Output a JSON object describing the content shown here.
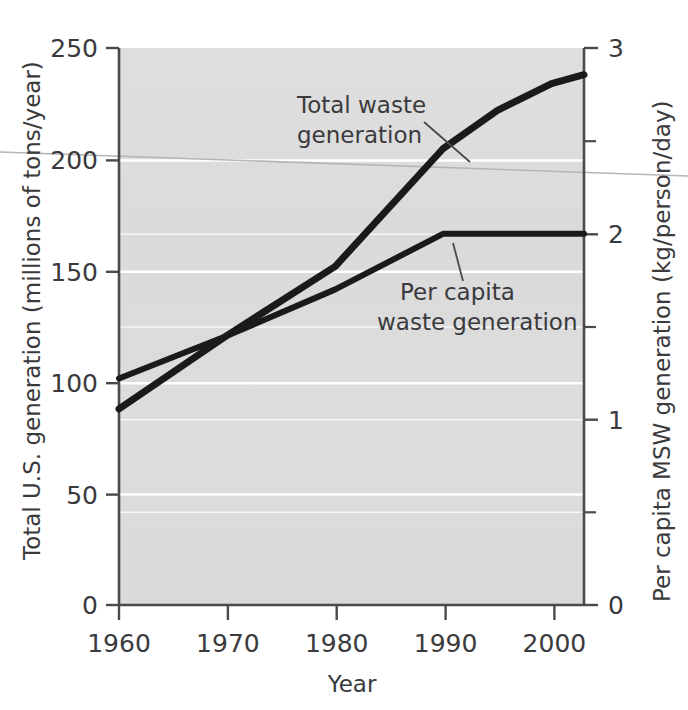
{
  "chart_data": {
    "type": "line",
    "title": "",
    "subtitle": "",
    "xlabel": "Year",
    "ylabel": "Total U.S. generation (millions of tons/year)",
    "y2label": "Per capita MSW generation (kg/person/day)",
    "xlim": [
      1960,
      2003
    ],
    "ylim": [
      0,
      250
    ],
    "y2lim": [
      0,
      3
    ],
    "grid": true,
    "grid_orientation": "horizontal",
    "grid_color": "#ffffff",
    "plot_background": "#dcdcdc",
    "line_color": "#1a1a1a",
    "legend": "none",
    "xticks": [
      1960,
      1970,
      1980,
      1990,
      2000
    ],
    "xtick_labels": [
      "1960",
      "1970",
      "1980",
      "1990",
      "2000"
    ],
    "yticks": [
      0,
      50,
      100,
      150,
      200,
      250
    ],
    "ytick_labels": [
      "0",
      "50",
      "100",
      "150",
      "200",
      "250"
    ],
    "y2ticks": [
      0,
      1,
      2,
      3
    ],
    "y2tick_labels": [
      "0",
      "1",
      "2",
      "3"
    ],
    "y2minorticks": [
      0.5,
      1.5,
      2.5
    ],
    "series": [
      {
        "name": "Total waste generation",
        "axis": "left",
        "units": "millions of tons/year",
        "x": [
          1960,
          1970,
          1980,
          1990,
          1995,
          2000,
          2003
        ],
        "values": [
          88,
          121,
          152,
          205,
          222,
          234,
          238
        ]
      },
      {
        "name": "Per capita waste generation",
        "axis": "right",
        "units": "kg/person/day",
        "x": [
          1960,
          1970,
          1980,
          1990,
          1995,
          2000,
          2003
        ],
        "values": [
          1.22,
          1.45,
          1.7,
          2.0,
          2.0,
          2.0,
          2.0
        ]
      }
    ],
    "annotations": [
      {
        "id": "total-waste-annotation",
        "text_line1": "Total waste",
        "text_line2": "generation",
        "target_series": "Total waste generation"
      },
      {
        "id": "per-capita-annotation",
        "text_line1": "Per capita",
        "text_line2": "waste generation",
        "target_series": "Per capita waste generation"
      }
    ]
  },
  "axes": {
    "left_title": "Total U.S. generation (millions of tons/year)",
    "right_title": "Per capita MSW generation (kg/person/day)",
    "bottom_title": "Year",
    "y_ticks": [
      "250",
      "200",
      "150",
      "100",
      "50",
      "0"
    ],
    "y2_ticks": [
      "3",
      "2",
      "1",
      "0"
    ],
    "x_ticks": [
      "1960",
      "1970",
      "1980",
      "1990",
      "2000"
    ]
  },
  "annotations": {
    "total_line1": "Total waste",
    "total_line2": "generation",
    "percapita_line1": "Per capita",
    "percapita_line2": "waste generation"
  },
  "colors": {
    "plot_bg": "#dcdcdc",
    "grid": "#ffffff",
    "line": "#1a1a1a",
    "axis": "#4a4a4a",
    "text": "#3a3a3c"
  }
}
